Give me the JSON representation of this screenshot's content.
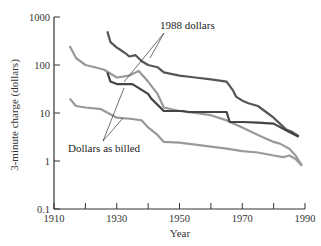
{
  "chart_data": {
    "type": "line",
    "title": "",
    "xlabel": "Year",
    "ylabel": "3-minute charge (dollars)",
    "yscale": "log",
    "xlim": [
      1910,
      1990
    ],
    "ylim": [
      0.1,
      1000
    ],
    "xticks": [
      1910,
      1920,
      1930,
      1940,
      1950,
      1960,
      1970,
      1980,
      1990
    ],
    "xtick_labels": [
      "1910",
      "1930",
      "1950",
      "1970",
      "1990"
    ],
    "yticks": [
      0.1,
      1,
      10,
      100,
      1000
    ],
    "ytick_labels": [
      "0.1",
      "1",
      "10",
      "100",
      "1000"
    ],
    "grid": false,
    "legend": "none (direct annotations)",
    "annotations": [
      {
        "text": "1988 dollars",
        "points_to": [
          "series 0",
          "series 1"
        ]
      },
      {
        "text": "Dollars as billed",
        "points_to": [
          "series 2",
          "series 3"
        ]
      }
    ],
    "series": [
      {
        "name": "Dark route, 1988 dollars",
        "color": "#555555",
        "x": [
          1927,
          1928,
          1930,
          1931,
          1933,
          1934,
          1936,
          1938,
          1940,
          1943,
          1945,
          1950,
          1955,
          1960,
          1965,
          1967,
          1968,
          1970,
          1972,
          1975,
          1978,
          1980,
          1982,
          1984,
          1986,
          1988
        ],
        "y": [
          500,
          300,
          230,
          210,
          170,
          150,
          160,
          120,
          100,
          90,
          70,
          60,
          55,
          50,
          45,
          30,
          22,
          18,
          16,
          14,
          10,
          8,
          6,
          4.5,
          4,
          3.3
        ]
      },
      {
        "name": "Light route, 1988 dollars",
        "color": "#999999",
        "x": [
          1915,
          1917,
          1920,
          1923,
          1926,
          1930,
          1934,
          1937,
          1940,
          1943,
          1945,
          1950,
          1955,
          1960,
          1965,
          1970,
          1975,
          1980,
          1982,
          1985,
          1987,
          1989
        ],
        "y": [
          250,
          140,
          100,
          90,
          80,
          55,
          60,
          75,
          45,
          25,
          13,
          11,
          10,
          9,
          7,
          5,
          3.5,
          2.5,
          2.3,
          1.8,
          1.3,
          0.8
        ]
      },
      {
        "name": "Dark route, dollars as billed",
        "color": "#444444",
        "x": [
          1927,
          1928,
          1930,
          1935,
          1940,
          1941,
          1945,
          1951,
          1953,
          1965,
          1966,
          1970,
          1975,
          1980,
          1985,
          1988
        ],
        "y": [
          70,
          45,
          40,
          40,
          25,
          20,
          11,
          11,
          10.5,
          10.5,
          6.5,
          6.5,
          6.3,
          6,
          4,
          3.2
        ]
      },
      {
        "name": "Light route, dollars as billed",
        "color": "#999999",
        "x": [
          1915,
          1917,
          1920,
          1925,
          1930,
          1935,
          1938,
          1940,
          1943,
          1945,
          1950,
          1955,
          1960,
          1965,
          1970,
          1975,
          1980,
          1983,
          1985,
          1987,
          1989
        ],
        "y": [
          20,
          14,
          13,
          12,
          8,
          7.5,
          7,
          5,
          3.5,
          2.5,
          2.4,
          2.2,
          2,
          1.8,
          1.6,
          1.5,
          1.3,
          1.2,
          1.3,
          1.1,
          0.8
        ]
      }
    ]
  }
}
